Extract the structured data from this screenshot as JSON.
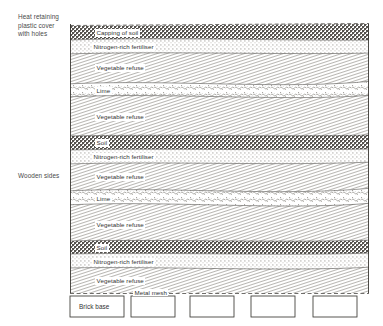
{
  "annotations": {
    "cover": "Heat retaining\nplastic cover\nwith holes",
    "wooden_sides": "Wooden sides",
    "brick_base": "Brick base",
    "metal_mesh": "Metal mesh"
  },
  "colors": {
    "ink": "#3a3a3a",
    "outline": "#2b2b2b",
    "soil_dark": "#6d6a66",
    "fertiliser_light": "#e9e7e2",
    "lime": "#dedcd6",
    "refuse": "#dcdad4",
    "background": "#ffffff"
  },
  "layers": [
    {
      "id": "capping-of-soil",
      "label": "Capping of soil",
      "fill": "soil",
      "top": 27,
      "bottom": 39
    },
    {
      "id": "nitrogen-fertiliser-1",
      "label": "Nitrogen-rich fertiliser",
      "fill": "fertiliser",
      "top": 39,
      "bottom": 53
    },
    {
      "id": "vegetable-refuse-1",
      "label": "Vegetable refuse",
      "fill": "refuse",
      "top": 53,
      "bottom": 83
    },
    {
      "id": "lime-1",
      "label": "Lime",
      "fill": "lime",
      "top": 83,
      "bottom": 97
    },
    {
      "id": "vegetable-refuse-2",
      "label": "Vegetable refuse",
      "fill": "refuse",
      "top": 97,
      "bottom": 136
    },
    {
      "id": "soil-1",
      "label": "Soil",
      "fill": "soil",
      "top": 136,
      "bottom": 149
    },
    {
      "id": "nitrogen-fertiliser-2",
      "label": "Nitrogen-rich fertiliser",
      "fill": "fertiliser",
      "top": 149,
      "bottom": 163
    },
    {
      "id": "vegetable-refuse-3",
      "label": "Vegetable refuse",
      "fill": "refuse",
      "top": 163,
      "bottom": 191
    },
    {
      "id": "lime-2",
      "label": "Lime",
      "fill": "lime",
      "top": 191,
      "bottom": 206
    },
    {
      "id": "vegetable-refuse-4",
      "label": "Vegetable refuse",
      "fill": "refuse",
      "top": 206,
      "bottom": 241
    },
    {
      "id": "soil-2",
      "label": "Soil",
      "fill": "soil",
      "top": 241,
      "bottom": 254
    },
    {
      "id": "nitrogen-fertiliser-3",
      "label": "Nitrogen-rich fertiliser",
      "fill": "fertiliser",
      "top": 254,
      "bottom": 268
    },
    {
      "id": "vegetable-refuse-5",
      "label": "Vegetable refuse",
      "fill": "refuse",
      "top": 268,
      "bottom": 293
    }
  ],
  "heap_box": {
    "left": 70,
    "right": 369,
    "top": 24,
    "bottom": 293
  },
  "bricks": [
    {
      "x": 70,
      "y": 295,
      "w": 54,
      "h": 22
    },
    {
      "x": 131,
      "y": 295,
      "w": 44,
      "h": 22
    },
    {
      "x": 190,
      "y": 295,
      "w": 44,
      "h": 22
    },
    {
      "x": 251,
      "y": 295,
      "w": 44,
      "h": 22
    },
    {
      "x": 313,
      "y": 295,
      "w": 44,
      "h": 22
    }
  ]
}
